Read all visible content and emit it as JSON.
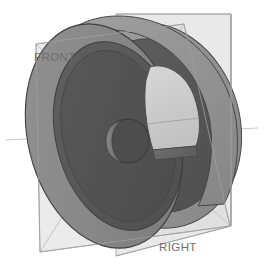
{
  "viewport": {
    "width": 268,
    "height": 272,
    "background_color": "#ffffff",
    "render_mode": "shaded-solid",
    "view_orientation": "isometric"
  },
  "model": {
    "name": "wheel-pulley-solid",
    "description": "Shaded grey solid of revolution: a wheel / pulley with an outer rim, a recessed inner web face, a central bore hub and one kidney-shaped lightening cutout through the web.",
    "colors": {
      "outer_face_light": "#8d8d8d",
      "outer_face_mid": "#848484",
      "rim_band_light": "#9a9a9a",
      "web_dark": "#5a5a5a",
      "web_dark_2": "#535353",
      "inner_bore_shadow": "#4a4a4a",
      "hub_highlight": "#7c7c7c",
      "cutout_interior": "#c8c8c8",
      "silhouette_edge": "#3f3f3f"
    },
    "features": [
      {
        "id": "outer-disc-face",
        "label": "outer disc face"
      },
      {
        "id": "rim-band",
        "label": "outer rim band"
      },
      {
        "id": "inner-web",
        "label": "recessed inner web"
      },
      {
        "id": "center-bore",
        "label": "center bore hub"
      },
      {
        "id": "lightening-hole",
        "label": "kidney lightening cutout"
      }
    ]
  },
  "reference_planes": [
    {
      "id": "front-plane",
      "label": "FRONT",
      "fill_color": "#d8d8d8",
      "edge_color": "#a5a5a5",
      "opacity": 0.55,
      "label_color": "#6e6e6e"
    },
    {
      "id": "right-plane",
      "label": "RIGHT",
      "fill_color": "#dcdcdc",
      "edge_color": "#a5a5a5",
      "opacity": 0.55,
      "label_color": "#6e6e6e"
    }
  ]
}
